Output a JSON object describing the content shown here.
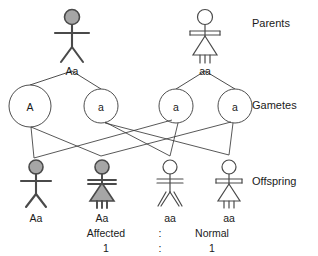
{
  "diagram": {
    "row_labels": [
      {
        "name": "parents",
        "text": "Parents",
        "x": 252,
        "y": 18
      },
      {
        "name": "gametes",
        "text": "Gametes",
        "x": 252,
        "y": 107
      },
      {
        "name": "offspring",
        "text": "Offspring",
        "x": 252,
        "y": 182
      }
    ],
    "parents": [
      {
        "id": "parent-father",
        "sex": "male",
        "affected": true,
        "genotype": "Aa",
        "x": 72,
        "figure_top": 10,
        "label_y": 57
      },
      {
        "id": "parent-mother",
        "sex": "female",
        "affected": false,
        "genotype": "aa",
        "x": 205,
        "figure_top": 10,
        "label_y": 57
      }
    ],
    "gametes": [
      {
        "id": "gamete-father-A",
        "allele": "A",
        "x": 30,
        "y": 106,
        "r": 21
      },
      {
        "id": "gamete-father-a",
        "allele": "a",
        "x": 101,
        "y": 106,
        "r": 17
      },
      {
        "id": "gamete-mother-a1",
        "allele": "a",
        "x": 176,
        "y": 106,
        "r": 17
      },
      {
        "id": "gamete-mother-a2",
        "allele": "a",
        "x": 235,
        "y": 106,
        "r": 17
      }
    ],
    "offspring": [
      {
        "id": "offspring-1",
        "sex": "male",
        "affected": true,
        "genotype": "Aa",
        "x": 36,
        "figure_top": 160,
        "label_y": 212,
        "phenotype": "Affected"
      },
      {
        "id": "offspring-2",
        "sex": "female",
        "affected": true,
        "genotype": "Aa",
        "x": 102,
        "figure_top": 160,
        "label_y": 212,
        "phenotype": "Affected"
      },
      {
        "id": "offspring-3",
        "sex": "male",
        "affected": false,
        "genotype": "aa",
        "x": 170,
        "figure_top": 160,
        "label_y": 212,
        "phenotype": "Normal"
      },
      {
        "id": "offspring-4",
        "sex": "female",
        "affected": false,
        "genotype": "aa",
        "x": 229,
        "figure_top": 160,
        "label_y": 212,
        "phenotype": "Normal"
      }
    ],
    "ratio": {
      "left_word": "Affected",
      "separator": ":",
      "right_word": "Normal",
      "left_value": "1",
      "right_value": "1",
      "words_y": 231,
      "values_y": 246,
      "left_x": 106,
      "sep_x": 160,
      "right_x": 212
    },
    "colors": {
      "affected_fill": "#a6a6a6",
      "unaffected_fill": "#ffffff",
      "stroke": "#3a3a3a",
      "line": "#3a3a3a",
      "text": "#1a1a1a",
      "background": "#ffffff"
    }
  }
}
